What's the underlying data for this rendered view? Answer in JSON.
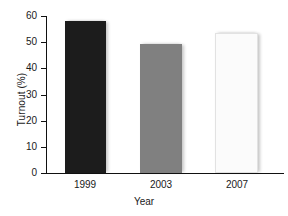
{
  "chart_data": {
    "type": "bar",
    "title": "",
    "categories": [
      "1999",
      "2003",
      "2007"
    ],
    "values": [
      58,
      49.5,
      53.5
    ],
    "series": [
      {
        "name": "Turnout",
        "values": [
          58,
          49.5,
          53.5
        ]
      }
    ],
    "xlabel": "Year",
    "ylabel": "Turnout (%)",
    "ylim": [
      0,
      60
    ],
    "ytick_values": [
      0,
      10,
      20,
      30,
      40,
      50,
      60
    ],
    "ytick_labels": [
      "0",
      "10",
      "20",
      "30",
      "40",
      "50",
      "60"
    ],
    "grid": false,
    "legend": false,
    "legend_position": "none",
    "bar_colors": [
      "#1c1c1c",
      "#808080",
      "#fbfbfb"
    ]
  },
  "axes": {
    "y": {
      "label": "Turnout (%)",
      "ticks": [
        {
          "label": "60",
          "value": 60
        },
        {
          "label": "50",
          "value": 50
        },
        {
          "label": "40",
          "value": 40
        },
        {
          "label": "30",
          "value": 30
        },
        {
          "label": "20",
          "value": 20
        },
        {
          "label": "10",
          "value": 10
        },
        {
          "label": "0",
          "value": 0
        }
      ]
    },
    "x": {
      "label": "Year",
      "ticks": [
        {
          "label": "1999"
        },
        {
          "label": "2003"
        },
        {
          "label": "2007"
        }
      ]
    }
  }
}
